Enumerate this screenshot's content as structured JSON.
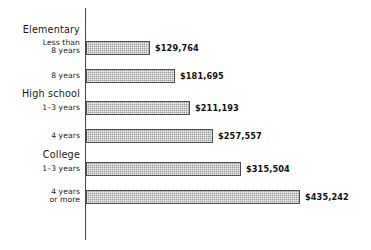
{
  "chart_data": {
    "type": "bar",
    "orientation": "horizontal",
    "title": "",
    "subtitle": "",
    "xlabel": "",
    "ylabel": "",
    "grid": false,
    "legend": null,
    "axis_origin_value": 0,
    "xlim": [
      0,
      435242
    ],
    "groups": [
      {
        "name": "Elementary",
        "categories": [
          "Less than\n8 years",
          "8 years"
        ]
      },
      {
        "name": "High school",
        "categories": [
          "1–3 years",
          "4 years"
        ]
      },
      {
        "name": "College",
        "categories": [
          "1–3 years",
          "4 years\nor more"
        ]
      }
    ],
    "categories": [
      "Less than\n8 years",
      "8 years",
      "1–3 years",
      "4 years",
      "1–3 years",
      "4 years\nor more"
    ],
    "values": [
      129764,
      181695,
      211193,
      257557,
      315504,
      435242
    ],
    "value_labels": [
      "$129,764",
      "$181,695",
      "$211,193",
      "$257,557",
      "$315,504",
      "$435,242"
    ],
    "colors": {
      "bar_fill": "#9c9c9c",
      "bar_border": "#4f4f4f",
      "axis": "#4a4a4a",
      "text": "#1a1a1a",
      "background": "#ffffff"
    }
  },
  "rows": [
    {
      "group": "Elementary",
      "label": "Less than\n8 years",
      "value_label": "$129,764",
      "value": 129764
    },
    {
      "group": "",
      "label": "8 years",
      "value_label": "$181,695",
      "value": 181695
    },
    {
      "group": "High school",
      "label": "1–3 years",
      "value_label": "$211,193",
      "value": 211193
    },
    {
      "group": "",
      "label": "4 years",
      "value_label": "$257,557",
      "value": 257557
    },
    {
      "group": "College",
      "label": "1–3 years",
      "value_label": "$315,504",
      "value": 315504
    },
    {
      "group": "",
      "label": "4 years\nor more",
      "value_label": "$435,242",
      "value": 435242
    }
  ],
  "group_headers": [
    {
      "label": "Elementary"
    },
    {
      "label": "High school"
    },
    {
      "label": "College"
    }
  ]
}
